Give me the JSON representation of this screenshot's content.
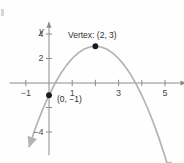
{
  "figure": {
    "kind": "coordinate-plane-parabola"
  },
  "axes": {
    "x_axis_label": "x",
    "y_axis_label": "y",
    "x_ticks": [
      {
        "label": "−1",
        "value": -1
      },
      {
        "label": "1",
        "value": 1
      },
      {
        "label": "3",
        "value": 3
      },
      {
        "label": "5",
        "value": 5
      }
    ],
    "y_ticks": [
      {
        "label": "4",
        "value": 4
      },
      {
        "label": "2",
        "value": 2
      },
      {
        "label": "−4",
        "value": -4
      }
    ]
  },
  "annotations": {
    "vertex_label": "Vertex: (2, 3)",
    "intercept_label": "(0, −1)"
  },
  "colors": {
    "curve": "#b3b3b3",
    "axis": "#8c8c8c",
    "point": "#1a1a1a",
    "text": "#333333",
    "background": "#fefefe"
  },
  "chart_data": {
    "type": "line",
    "title": "",
    "subtitle": "",
    "xlabel": "x",
    "ylabel": "y",
    "xlim": [
      -1.7,
      5.9
    ],
    "ylim": [
      -5.9,
      5.0
    ],
    "grid": false,
    "legend": null,
    "function": "y = -(x - 2)^2 + 3",
    "series": [
      {
        "name": "parabola",
        "color": "#b3b3b3",
        "arrow_start": true,
        "arrow_end": true,
        "x": [
          -0.85,
          -0.6,
          -0.4,
          -0.2,
          0,
          0.25,
          0.5,
          0.75,
          1,
          1.25,
          1.5,
          1.75,
          2,
          2.25,
          2.5,
          2.75,
          3,
          3.25,
          3.5,
          3.75,
          4,
          4.25,
          4.5,
          4.75,
          5,
          5.2
        ],
        "y": [
          -5.18,
          -3.76,
          -2.76,
          -1.84,
          -1,
          -0.0625,
          0.75,
          1.4375,
          2,
          2.4375,
          2.75,
          2.9375,
          3,
          2.9375,
          2.75,
          2.4375,
          2,
          1.4375,
          0.75,
          -0.0625,
          -1,
          -2.0625,
          -3.25,
          -4.5625,
          -6,
          -7.24
        ]
      }
    ],
    "points": [
      {
        "name": "vertex",
        "x": 2,
        "y": 3,
        "label": "Vertex: (2, 3)",
        "marker": "filled-circle",
        "color": "#1a1a1a"
      },
      {
        "name": "y-intercept",
        "x": 0,
        "y": -1,
        "label": "(0, −1)",
        "marker": "filled-circle",
        "color": "#1a1a1a"
      }
    ],
    "x_ticks": [
      -1,
      1,
      3,
      5
    ],
    "y_ticks": [
      4,
      2,
      -4
    ],
    "x_tick_labels": [
      "−1",
      "1",
      "3",
      "5"
    ],
    "y_tick_labels": [
      "4",
      "2",
      "−4"
    ]
  }
}
